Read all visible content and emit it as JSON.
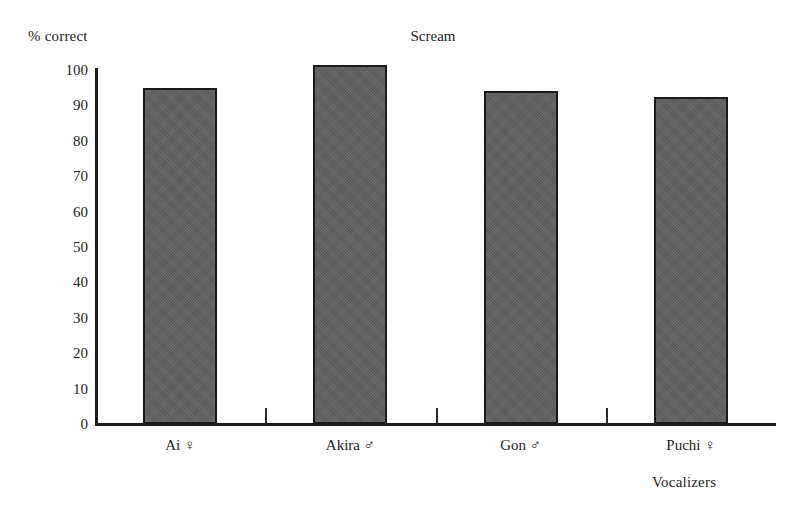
{
  "chart_data": {
    "type": "bar",
    "title": "Scream",
    "xlabel": "Vocalizers",
    "ylabel": "% correct",
    "categories": [
      "Ai ♀",
      "Akira ♂",
      "Gon ♂",
      "Puchi ♀"
    ],
    "values": [
      95,
      101.5,
      94,
      92.5
    ],
    "ylim": [
      0,
      100
    ],
    "ytick_labels": [
      "100",
      "90",
      "80",
      "70",
      "60",
      "50",
      "40",
      "30",
      "20",
      "10",
      "0"
    ],
    "ytick_values": [
      100,
      90,
      80,
      70,
      60,
      50,
      40,
      30,
      20,
      10,
      0
    ],
    "grid": false,
    "legend": null,
    "bar_color": "#5e5e5e",
    "bar_edge_color": "#1b1b1b",
    "axis_color": "#1d1d1d",
    "background": "#ffffff"
  }
}
